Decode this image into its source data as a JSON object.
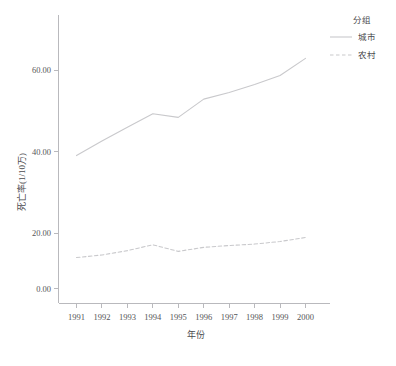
{
  "chart_data": {
    "type": "line",
    "title": "",
    "xlabel": "年份",
    "ylabel": "死亡率(1/10万)",
    "categories": [
      "1991",
      "1992",
      "1993",
      "1994",
      "1995",
      "1996",
      "1997",
      "1998",
      "1999",
      "2000"
    ],
    "x": [
      1991,
      1992,
      1993,
      1994,
      1995,
      1996,
      1997,
      1998,
      1999,
      2000
    ],
    "series": [
      {
        "name": "城市",
        "style": "solid",
        "color": "#c9c9cc",
        "values": [
          36.5,
          40.5,
          44.3,
          48.0,
          47.0,
          52.0,
          53.8,
          56.0,
          58.5,
          63.2
        ]
      },
      {
        "name": "农村",
        "style": "dashed",
        "color": "#c9c9cc",
        "values": [
          8.5,
          9.2,
          10.4,
          12.0,
          10.2,
          11.3,
          11.8,
          12.2,
          12.9,
          14.0
        ]
      }
    ],
    "ylim": [
      0,
      72
    ],
    "yticks": [
      0,
      20,
      40,
      60
    ],
    "ytick_labels": [
      "0.00",
      "20.00",
      "40.00",
      "60.00"
    ],
    "grid": false,
    "legend_position": "top-right"
  },
  "legend": {
    "title": "分组",
    "entries": [
      {
        "label": "城市",
        "style": "solid"
      },
      {
        "label": "农村",
        "style": "dashed"
      }
    ]
  },
  "axes": {
    "x_title": "年份",
    "y_title": "死亡率(1/10万)"
  },
  "colors": {
    "line": "#c9c9cc",
    "axis": "#b9b9bd",
    "text": "#4a4a4d",
    "background": "#ffffff"
  }
}
